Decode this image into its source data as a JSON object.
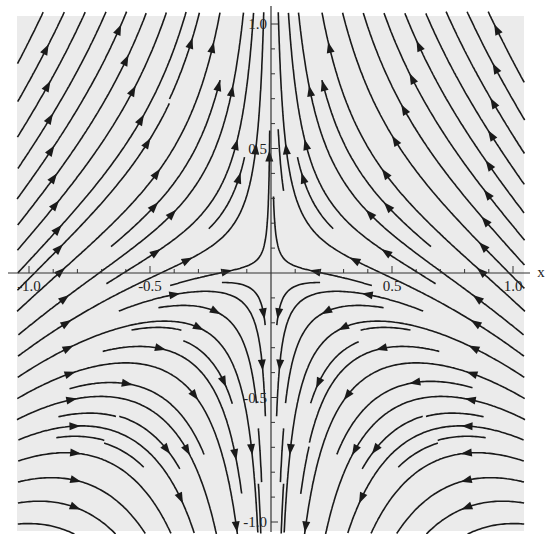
{
  "chart_data": {
    "type": "streamplot",
    "title": "",
    "field": {
      "u": "-x",
      "v": "y + x^2"
    },
    "xlabel": "x",
    "ylabel": "",
    "xlim": [
      -1.05,
      1.05
    ],
    "ylim": [
      -1.05,
      1.05
    ],
    "x_ticks": [
      {
        "value": -1.0,
        "label": "-1.0"
      },
      {
        "value": -0.5,
        "label": "-0.5"
      },
      {
        "value": 0.5,
        "label": "0.5"
      },
      {
        "value": 1.0,
        "label": "1.0"
      }
    ],
    "y_ticks": [
      {
        "value": 1.0,
        "label": "1.0"
      },
      {
        "value": 0.5,
        "label": "0.5"
      },
      {
        "value": -0.5,
        "label": "-0.5"
      },
      {
        "value": -1.0,
        "label": "-1.0"
      }
    ],
    "minor_tick_step": 0.1,
    "grid": false,
    "legend": null,
    "background_color": "#ebebeb",
    "stream_color": "#1a1a1a",
    "axis_color": "#333333"
  },
  "layout": {
    "plot_left": 17,
    "plot_top": 16,
    "plot_right": 524,
    "plot_bottom": 531,
    "x_min_px": 29,
    "x_max_px": 513,
    "y_max_px": 24,
    "y_min_px": 522
  }
}
